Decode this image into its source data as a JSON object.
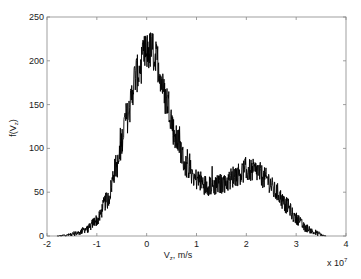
{
  "chart_data": {
    "type": "line",
    "title": "",
    "xlabel": "V_z, m/s",
    "ylabel": "f(V_z)",
    "x_scale_note": "x 10^7",
    "xlim": [
      -2,
      4
    ],
    "ylim": [
      0,
      250
    ],
    "xticks": [
      -2,
      -1,
      0,
      1,
      2,
      3,
      4
    ],
    "yticks": [
      0,
      50,
      100,
      150,
      200,
      250
    ],
    "grid": false,
    "legend": null,
    "series": [
      {
        "name": "f(V_z)",
        "color": "#000000",
        "x": [
          -1.8,
          -1.6,
          -1.4,
          -1.2,
          -1.0,
          -0.8,
          -0.6,
          -0.4,
          -0.2,
          0.0,
          0.1,
          0.2,
          0.4,
          0.6,
          0.8,
          1.0,
          1.2,
          1.4,
          1.6,
          1.8,
          2.0,
          2.2,
          2.4,
          2.6,
          2.8,
          3.0,
          3.2,
          3.4,
          3.6
        ],
        "values": [
          0,
          1,
          3,
          8,
          18,
          40,
          80,
          135,
          185,
          210,
          212,
          200,
          155,
          110,
          80,
          65,
          58,
          58,
          62,
          70,
          75,
          74,
          65,
          50,
          35,
          20,
          9,
          3,
          0
        ]
      }
    ],
    "annotations": {
      "peak_max_spike": 234,
      "peak_location": 0.05,
      "second_peak_location": 2.1,
      "second_peak_value": 75
    }
  },
  "axes": {
    "x_label_main": "V",
    "x_label_sub": "z",
    "x_label_rest": ", m/s",
    "y_label_main": "f(V",
    "y_label_sub": "z",
    "y_label_rest": ")",
    "exponent_base": "x 10",
    "exponent_power": "7",
    "xtick_labels": [
      "-2",
      "-1",
      "0",
      "1",
      "2",
      "3",
      "4"
    ],
    "ytick_labels": [
      "0",
      "50",
      "100",
      "150",
      "200",
      "250"
    ]
  }
}
